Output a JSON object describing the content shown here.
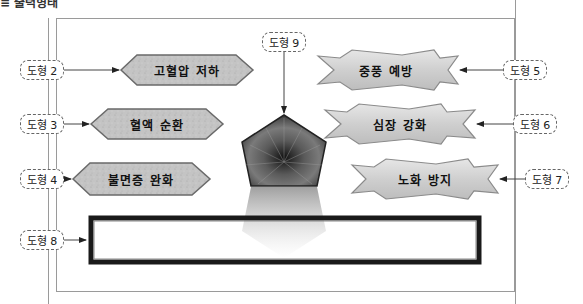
{
  "header": {
    "title": "≡ 출력형태"
  },
  "labels": {
    "l2": "도형 2",
    "l3": "도형 3",
    "l4": "도형 4",
    "l5": "도형 5",
    "l6": "도형 6",
    "l7": "도형 7",
    "l8": "도형 8",
    "l9": "도형 9"
  },
  "shapes": {
    "left": [
      {
        "id": "shape-2",
        "text": "고혈압 저하",
        "type": "octagon"
      },
      {
        "id": "shape-3",
        "text": "혈액 순환",
        "type": "octagon"
      },
      {
        "id": "shape-4",
        "text": "불면증 완화",
        "type": "octagon"
      }
    ],
    "right": [
      {
        "id": "shape-5",
        "text": "중풍 예방",
        "type": "star-banner"
      },
      {
        "id": "shape-6",
        "text": "심장 강화",
        "type": "star-banner"
      },
      {
        "id": "shape-7",
        "text": "노화 방지",
        "type": "star-banner"
      }
    ],
    "center": {
      "id": "shape-9",
      "type": "pentagon",
      "fill": "texture-dark"
    },
    "bottom": {
      "id": "shape-8",
      "type": "rectangle",
      "text": ""
    }
  },
  "colors": {
    "frame": "#9a9a9a",
    "octagon_fill": "#c4c4c4",
    "banner_fill": "#d6d6d6",
    "rect_border": "#1a1a1a",
    "pentagon": "#3a3a3a"
  }
}
